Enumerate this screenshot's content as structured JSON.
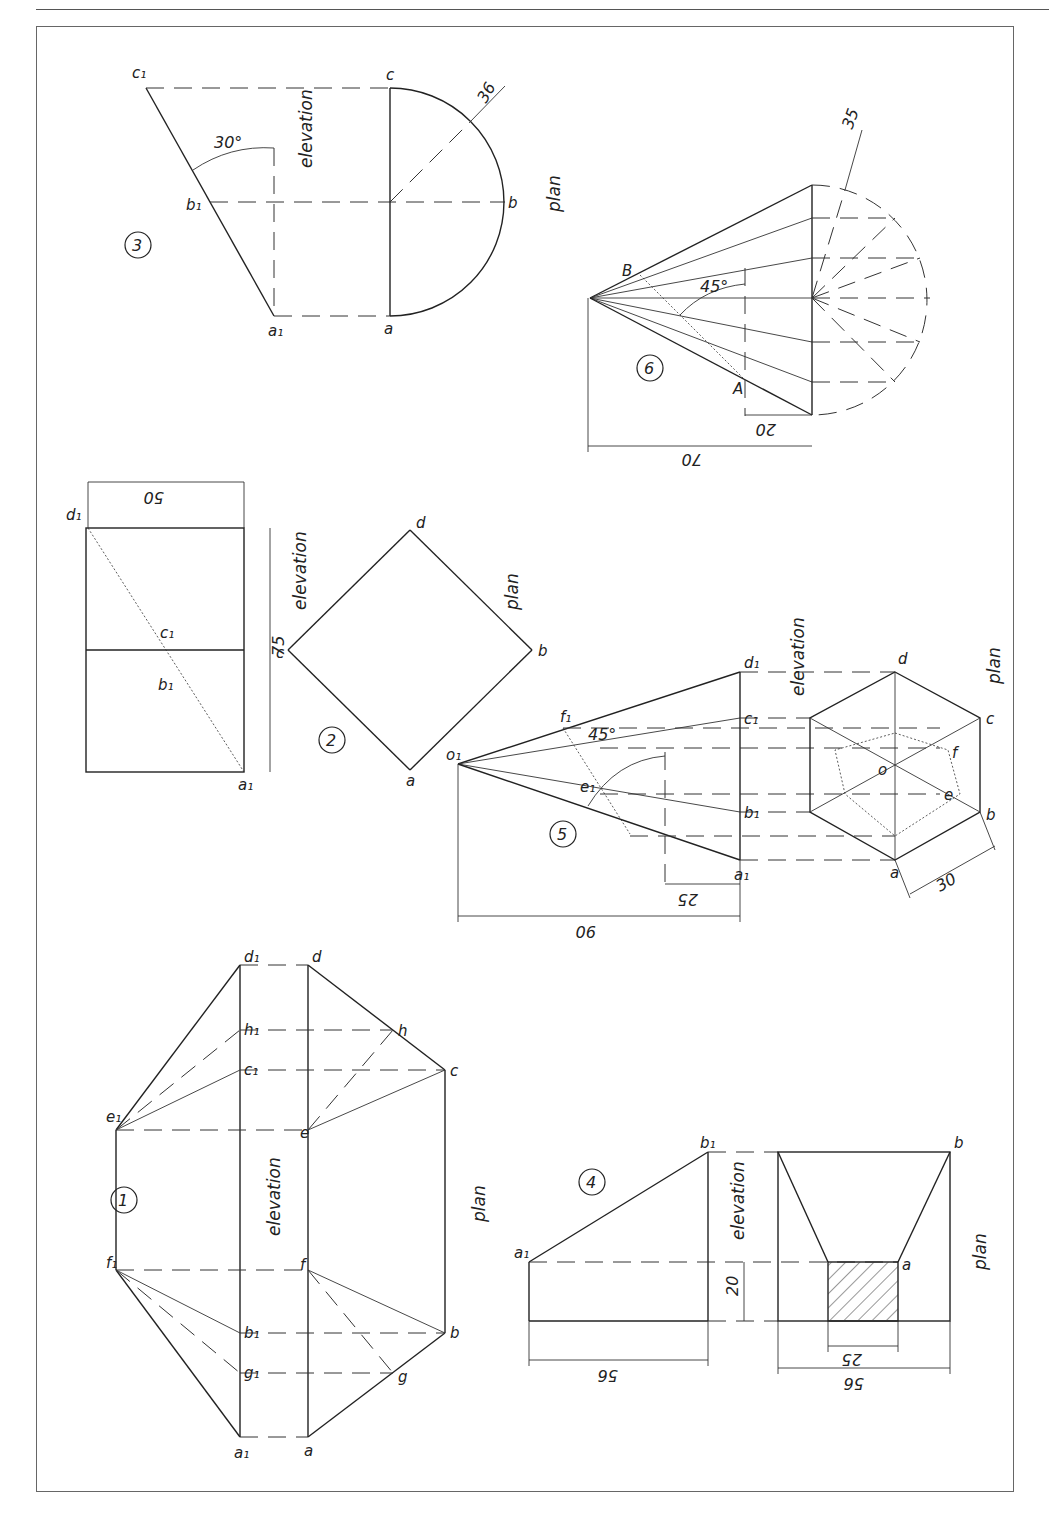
{
  "page": {
    "orientation": "rotated-90-clockwise"
  },
  "figures": [
    {
      "id": "1",
      "number_label": "1",
      "elevation_label": "elevation",
      "plan_label": "plan",
      "elevation_points": [
        "a1",
        "g1",
        "b1",
        "f1",
        "e1",
        "c1",
        "h1",
        "d1"
      ],
      "plan_points": [
        "a",
        "g",
        "b",
        "f",
        "e",
        "c",
        "h",
        "d"
      ]
    },
    {
      "id": "2",
      "number_label": "2",
      "elevation_label": "elevation",
      "plan_label": "plan",
      "elevation_points": [
        "a1",
        "b1",
        "c1",
        "d1"
      ],
      "plan_points": [
        "a",
        "b",
        "c",
        "d"
      ],
      "dimensions": [
        "75",
        "50"
      ]
    },
    {
      "id": "3",
      "number_label": "3",
      "elevation_label": "elevation",
      "plan_label": "plan",
      "elevation_points": [
        "a1",
        "b1",
        "c1"
      ],
      "plan_points": [
        "a",
        "b",
        "c"
      ],
      "dimensions": [
        "36",
        "30°"
      ]
    },
    {
      "id": "4",
      "number_label": "4",
      "elevation_label": "elevation",
      "plan_label": "plan",
      "elevation_points": [
        "a1",
        "b1"
      ],
      "plan_points": [
        "a",
        "b"
      ],
      "dimensions": [
        "56",
        "20",
        "25",
        "56"
      ]
    },
    {
      "id": "5",
      "number_label": "5",
      "elevation_label": "elevation",
      "plan_label": "plan",
      "elevation_points": [
        "o1",
        "a1",
        "b1",
        "c1",
        "d1",
        "e1",
        "f1"
      ],
      "plan_points": [
        "a",
        "b",
        "c",
        "d",
        "e",
        "f",
        "o"
      ],
      "dimensions": [
        "90",
        "25",
        "45°",
        "30"
      ]
    },
    {
      "id": "6",
      "number_label": "6",
      "elevation_points": [
        "A",
        "B"
      ],
      "dimensions": [
        "70",
        "20",
        "45°",
        "35"
      ]
    }
  ],
  "labels": {
    "f1": {
      "o1": "o₁",
      "a1": "a₁",
      "b1": "b₁",
      "c1": "c₁",
      "d1": "d₁",
      "e1": "e₁",
      "f1": "f₁",
      "g1": "g₁",
      "h1": "h₁",
      "a": "a",
      "b": "b",
      "c": "c",
      "d": "d",
      "e": "e",
      "f": "f",
      "g": "g",
      "h": "h",
      "o": "o",
      "A": "A",
      "B": "B"
    }
  },
  "strings": {
    "n1": "1",
    "n2": "2",
    "n3": "3",
    "n4": "4",
    "n5": "5",
    "n6": "6",
    "elev": "elevation",
    "plan": "plan",
    "d75": "75",
    "d50": "50",
    "d36": "36",
    "d30deg": "30°",
    "d56": "56",
    "d20": "20",
    "d25": "25",
    "d90": "90",
    "d45deg": "45°",
    "d30": "30",
    "d70": "70",
    "d35": "35",
    "d20b": "20"
  }
}
